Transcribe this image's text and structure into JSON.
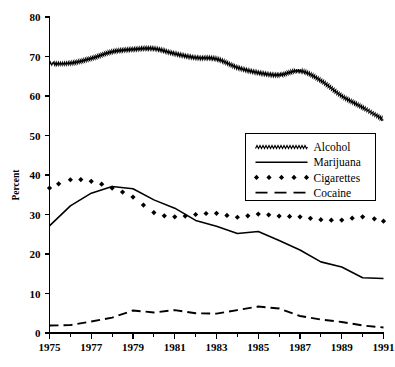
{
  "chart_data": {
    "type": "line",
    "title": "",
    "subtitle": "",
    "xlabel": "",
    "ylabel": "Percent",
    "xlim": [
      1975,
      1991
    ],
    "ylim": [
      0,
      80
    ],
    "grid": false,
    "legend_position": "center-right",
    "x": [
      1975,
      1976,
      1977,
      1978,
      1979,
      1980,
      1981,
      1982,
      1983,
      1984,
      1985,
      1986,
      1987,
      1988,
      1989,
      1990,
      1991
    ],
    "xticks": [
      1975,
      1977,
      1979,
      1981,
      1983,
      1985,
      1987,
      1989,
      1991
    ],
    "xtick_labels": [
      "1975",
      "1977",
      "1979",
      "1981",
      "1983",
      "1985",
      "1987",
      "1989",
      "1991"
    ],
    "yticks": [
      0,
      10,
      20,
      30,
      40,
      50,
      60,
      70,
      80
    ],
    "ytick_labels": [
      "0",
      "10",
      "20",
      "30",
      "40",
      "50",
      "60",
      "70",
      "80"
    ],
    "series": [
      {
        "name": "Alcohol",
        "style": "zigzag",
        "values": [
          68.2,
          68.3,
          69.5,
          71.2,
          71.8,
          72.0,
          70.7,
          69.7,
          69.4,
          67.2,
          65.9,
          65.3,
          66.4,
          63.9,
          60.0,
          57.1,
          54.0
        ]
      },
      {
        "name": "Marijuana",
        "style": "solid",
        "values": [
          27.1,
          32.2,
          35.4,
          37.1,
          36.5,
          33.7,
          31.6,
          28.5,
          27.0,
          25.2,
          25.7,
          23.4,
          21.0,
          18.0,
          16.7,
          14.0,
          13.8
        ]
      },
      {
        "name": "Cigarettes",
        "style": "markers",
        "values": [
          36.7,
          38.8,
          38.4,
          36.7,
          34.4,
          30.5,
          29.4,
          30.0,
          30.3,
          29.3,
          30.1,
          29.6,
          29.4,
          28.7,
          28.6,
          29.4,
          28.3
        ]
      },
      {
        "name": "Cocaine",
        "style": "dashed",
        "values": [
          1.9,
          2.0,
          2.9,
          3.9,
          5.7,
          5.2,
          5.8,
          5.0,
          4.9,
          5.8,
          6.7,
          6.2,
          4.3,
          3.4,
          2.8,
          1.9,
          1.4
        ]
      }
    ],
    "legend_entries": [
      {
        "label": "Alcohol",
        "style": "zigzag"
      },
      {
        "label": "Marijuana",
        "style": "solid"
      },
      {
        "label": "Cigarettes",
        "style": "markers"
      },
      {
        "label": "Cocaine",
        "style": "dashed"
      }
    ],
    "colors": {
      "line": "#000000",
      "axis": "#000000",
      "background": "#ffffff"
    }
  }
}
